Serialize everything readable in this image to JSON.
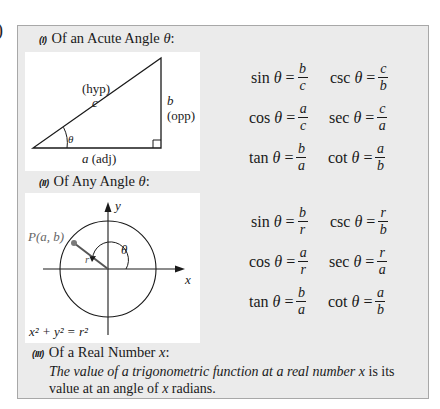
{
  "edge_fragment": ")",
  "section_1": {
    "number": "(I)",
    "title": "Of an Acute Angle ",
    "symbol": "θ",
    "colon": ":",
    "diagram": {
      "hyp_label": "(hyp)",
      "hyp_var": "c",
      "opp_var": "b",
      "opp_label": "(opp)",
      "adj_var": "a",
      "adj_label": " (adj)",
      "angle": "θ"
    },
    "formulas": [
      {
        "fn": "sin",
        "arg": "θ",
        "num": "b",
        "den": "c"
      },
      {
        "fn": "csc",
        "arg": "θ",
        "num": "c",
        "den": "b"
      },
      {
        "fn": "cos",
        "arg": "θ",
        "num": "a",
        "den": "c"
      },
      {
        "fn": "sec",
        "arg": "θ",
        "num": "c",
        "den": "a"
      },
      {
        "fn": "tan",
        "arg": "θ",
        "num": "b",
        "den": "a"
      },
      {
        "fn": "cot",
        "arg": "θ",
        "num": "a",
        "den": "b"
      }
    ]
  },
  "section_2": {
    "number": "(II)",
    "title": "Of Any Angle ",
    "symbol": "θ",
    "colon": ":",
    "diagram": {
      "point_label": "P(a, b)",
      "y_label": "y",
      "x_label": "x",
      "r_label": "r",
      "angle": "θ",
      "equation": "x² + y² = r²"
    },
    "formulas": [
      {
        "fn": "sin",
        "arg": "θ",
        "num": "b",
        "den": "r"
      },
      {
        "fn": "csc",
        "arg": "θ",
        "num": "r",
        "den": "b"
      },
      {
        "fn": "cos",
        "arg": "θ",
        "num": "a",
        "den": "r"
      },
      {
        "fn": "sec",
        "arg": "θ",
        "num": "r",
        "den": "a"
      },
      {
        "fn": "tan",
        "arg": "θ",
        "num": "b",
        "den": "a"
      },
      {
        "fn": "cot",
        "arg": "θ",
        "num": "a",
        "den": "b"
      }
    ]
  },
  "section_3": {
    "number": "(III)",
    "title": "Of a Real Number ",
    "symbol": "x",
    "colon": ":",
    "description_italic": "The value of a trigonometric function at a real number ",
    "description_var": "x",
    "description_mid": " is its value at an angle of ",
    "description_var2": "x",
    "description_end": " radians."
  },
  "colors": {
    "box_background": "#ebebeb",
    "box_border": "#a8a8a8",
    "panel_background": "#ffffff",
    "ink": "#1a1a1a",
    "point_gray": "#7a7a7a"
  }
}
